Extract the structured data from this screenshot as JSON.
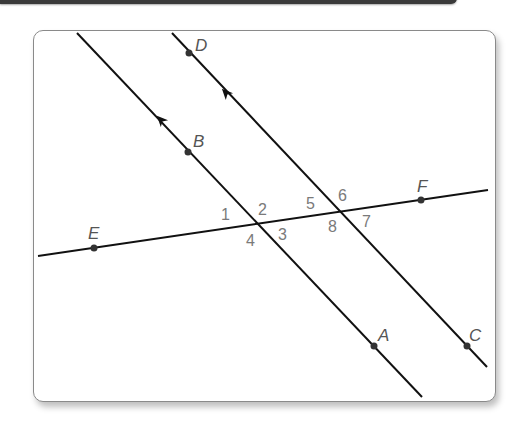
{
  "diagram": {
    "type": "parallel-lines-transversal",
    "colors": {
      "line": "#111111",
      "point": "#333333",
      "point_label": "#555555",
      "angle_label": "#7a7a7a",
      "frame_border": "#8a8a8a",
      "top_bar": "#3a3a3a"
    },
    "lines": [
      {
        "name": "line-BA",
        "points": [
          "B",
          "A"
        ],
        "parallel_arrow": true
      },
      {
        "name": "line-DC",
        "points": [
          "D",
          "C"
        ],
        "parallel_arrow": true
      },
      {
        "name": "transversal-EF",
        "points": [
          "E",
          "F"
        ],
        "parallel_arrow": false
      }
    ],
    "points": {
      "A": "A",
      "B": "B",
      "C": "C",
      "D": "D",
      "E": "E",
      "F": "F"
    },
    "angles": {
      "a1": "1",
      "a2": "2",
      "a3": "3",
      "a4": "4",
      "a5": "5",
      "a6": "6",
      "a7": "7",
      "a8": "8"
    }
  }
}
